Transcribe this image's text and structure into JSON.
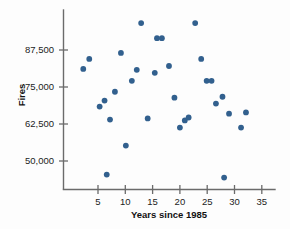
{
  "chart_data": {
    "type": "scatter",
    "title": "",
    "xlabel": "Years since 1985",
    "ylabel": "Fires",
    "xlim": [
      0,
      36.5
    ],
    "ylim": [
      41000,
      100500
    ],
    "xticks": [
      5,
      10,
      15,
      20,
      25,
      30,
      35
    ],
    "xtick_labels": [
      "5",
      "10",
      "15",
      "20",
      "25",
      "30",
      "35"
    ],
    "yticks": [
      50000,
      62500,
      75000,
      87500
    ],
    "ytick_labels": [
      "50,000",
      "62,500",
      "75,000",
      "87,500"
    ],
    "grid": false,
    "legend": null,
    "marker_color": "#32608e",
    "axis_color": "#6b6b6b",
    "points": [
      {
        "x": 2.3,
        "y": 81100
      },
      {
        "x": 3.4,
        "y": 84500
      },
      {
        "x": 5.3,
        "y": 68400
      },
      {
        "x": 6.2,
        "y": 70400
      },
      {
        "x": 6.6,
        "y": 45400
      },
      {
        "x": 7.2,
        "y": 64000
      },
      {
        "x": 8.1,
        "y": 73400
      },
      {
        "x": 9.2,
        "y": 86500
      },
      {
        "x": 10.1,
        "y": 55200
      },
      {
        "x": 11.2,
        "y": 77100
      },
      {
        "x": 12.1,
        "y": 80800
      },
      {
        "x": 12.9,
        "y": 96600
      },
      {
        "x": 14.1,
        "y": 64400
      },
      {
        "x": 15.4,
        "y": 79800
      },
      {
        "x": 15.8,
        "y": 91500
      },
      {
        "x": 16.7,
        "y": 91500
      },
      {
        "x": 18.0,
        "y": 82100
      },
      {
        "x": 19.0,
        "y": 71400
      },
      {
        "x": 20.0,
        "y": 61300
      },
      {
        "x": 20.9,
        "y": 63700
      },
      {
        "x": 21.6,
        "y": 64700
      },
      {
        "x": 22.8,
        "y": 96600
      },
      {
        "x": 23.9,
        "y": 84500
      },
      {
        "x": 24.9,
        "y": 77100
      },
      {
        "x": 25.8,
        "y": 77100
      },
      {
        "x": 26.6,
        "y": 69400
      },
      {
        "x": 27.8,
        "y": 71700
      },
      {
        "x": 28.1,
        "y": 44400
      },
      {
        "x": 29.0,
        "y": 66000
      },
      {
        "x": 31.2,
        "y": 61300
      },
      {
        "x": 32.1,
        "y": 66400
      }
    ]
  }
}
